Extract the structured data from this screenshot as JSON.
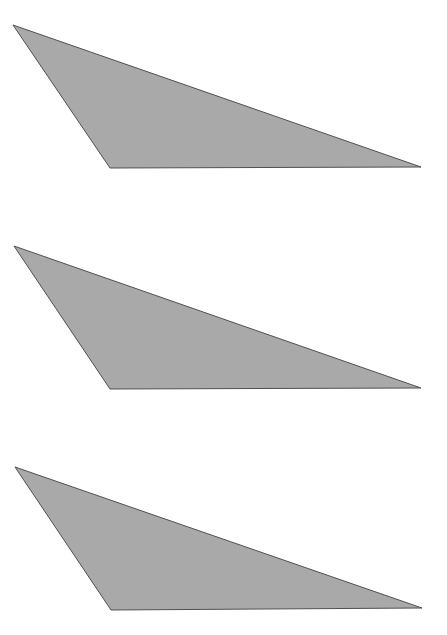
{
  "diagram": {
    "type": "shapes",
    "fill_color": "#a9a9a9",
    "stroke_color": "#505050",
    "background_color": "#ffffff",
    "shapes": [
      {
        "name": "triangle-1",
        "kind": "triangle"
      },
      {
        "name": "triangle-2",
        "kind": "triangle"
      },
      {
        "name": "triangle-3",
        "kind": "triangle"
      }
    ]
  }
}
